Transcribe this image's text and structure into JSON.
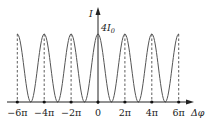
{
  "diagram": {
    "y_axis_label": "I",
    "x_axis_label": "Δφ",
    "peak_label": "4I",
    "peak_label_sub": "0",
    "tick_labels": [
      "−6π",
      "−4π",
      "−2π",
      "0",
      "2π",
      "4π",
      "6π"
    ],
    "colors": {
      "curve": "#555555",
      "axis": "#222222",
      "dash": "#333333"
    }
  },
  "chart_data": {
    "type": "line",
    "title": "",
    "xlabel": "Δφ",
    "ylabel": "I",
    "x_ticks": [
      "−6π",
      "−4π",
      "−2π",
      "0",
      "2π",
      "4π",
      "6π"
    ],
    "x_tick_values": [
      -18.85,
      -12.57,
      -6.28,
      0,
      6.28,
      12.57,
      18.85
    ],
    "function": "I = 4 I0 cos^2(Δφ/2)",
    "y_max_label": "4I0",
    "y_range": [
      0,
      "4I0"
    ],
    "x_range": [
      "-6π",
      "6π"
    ],
    "peaks_at": [
      "−6π",
      "−4π",
      "−2π",
      "0",
      "2π",
      "4π",
      "6π"
    ],
    "minima_at": [
      "−5π",
      "−3π",
      "−π",
      "π",
      "3π",
      "5π"
    ],
    "grid": false
  }
}
